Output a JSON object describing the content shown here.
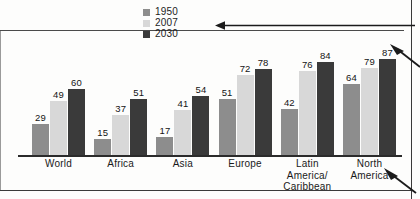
{
  "chart_data": {
    "type": "bar",
    "title": "",
    "subtitle": "",
    "xlabel": "",
    "ylabel": "",
    "ylim": [
      0,
      100
    ],
    "grid": false,
    "legend_position": "top-center",
    "categories": [
      "World",
      "Africa",
      "Asia",
      "Europe",
      "Latin America/ Caribbean",
      "North America"
    ],
    "category_lines": [
      [
        "World"
      ],
      [
        "Africa"
      ],
      [
        "Asia"
      ],
      [
        "Europe"
      ],
      [
        "Latin",
        "America/",
        "Caribbean"
      ],
      [
        "North",
        "America"
      ]
    ],
    "series": [
      {
        "name": "1950",
        "color": "#8d8d8d",
        "values": [
          29,
          15,
          17,
          51,
          42,
          64
        ]
      },
      {
        "name": "2007",
        "color": "#d8d8d8",
        "values": [
          49,
          37,
          41,
          72,
          76,
          79
        ]
      },
      {
        "name": "2030",
        "color": "#3a3a3a",
        "values": [
          60,
          51,
          54,
          78,
          84,
          87
        ]
      }
    ]
  },
  "legend": {
    "items": [
      {
        "label": "1950",
        "color": "#8d8d8d"
      },
      {
        "label": "2007",
        "color": "#d8d8d8"
      },
      {
        "label": "2030",
        "color": "#3a3a3a"
      }
    ]
  },
  "annotations": {
    "top_arrow": "horizontal-arrow-pointing-left",
    "right_arrow": "diagonal-arrow-pointing-upper-left",
    "bottom_right_arrow": "diagonal-arrow-pointing-upper-left"
  },
  "colors": {
    "series_1950": "#8d8d8d",
    "series_2007": "#d8d8d8",
    "series_2030": "#3a3a3a",
    "axis": "#2b2b2b",
    "text": "#1a1a1a",
    "background": "#fdfdfc"
  }
}
